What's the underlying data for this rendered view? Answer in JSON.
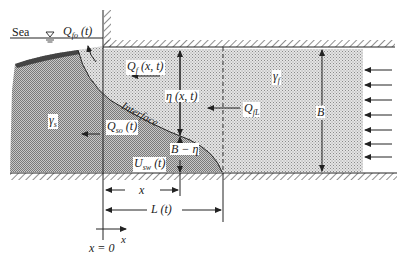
{
  "figure": {
    "type": "saltwater-freshwater interface diagram (coastal aquifer)",
    "colors": {
      "freshwater_fill": "#d9d9d9",
      "saltwater_fill": "#a9a9a9",
      "line": "#222222",
      "hatch": "#333333"
    }
  },
  "labels": {
    "sea": "Sea",
    "q_fo_main": "Q",
    "q_fo_sub": "fo",
    "q_fo_arg": " (t)",
    "q_f_main": "Q",
    "q_f_sub": "f",
    "q_f_arg": " (x, t)",
    "eta": "η (x, t)",
    "interface": "Interface",
    "q_fl_main": "Q",
    "q_fl_sub": "fL",
    "gamma_f_main": "γ",
    "gamma_f_sub": "f",
    "gamma_s_main": "γ",
    "gamma_s_sub": "s",
    "q_so_main": "Q",
    "q_so_sub": "so",
    "q_so_arg": " (t)",
    "u_sw_main": "U",
    "u_sw_sub": "sw",
    "u_sw_arg": " (t)",
    "b_minus_eta": "B − η",
    "b": "B",
    "x_dim": "x",
    "l_dim": "L (t)",
    "x_axis": "x",
    "x_origin": "x = 0"
  },
  "inflow_arrows_count": 7
}
